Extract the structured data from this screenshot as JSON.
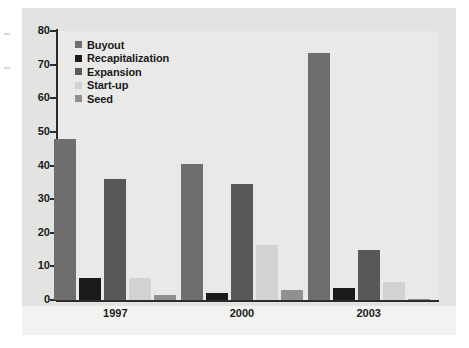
{
  "chart_data": {
    "type": "bar",
    "title": "",
    "xlabel": "",
    "ylabel": "",
    "ylim": [
      0,
      80
    ],
    "yticks": [
      0,
      10,
      20,
      30,
      40,
      50,
      60,
      70,
      80
    ],
    "grid": false,
    "legend_position": "top-left",
    "categories": [
      "1997",
      "2000",
      "2003"
    ],
    "series": [
      {
        "name": "Buyout",
        "color": "#6e6e6e",
        "values": [
          48,
          40.5,
          73.5
        ]
      },
      {
        "name": "Recapitalization",
        "color": "#1a1a1a",
        "values": [
          6.5,
          2,
          3.5
        ]
      },
      {
        "name": "Expansion",
        "color": "#585858",
        "values": [
          36,
          34.5,
          15
        ]
      },
      {
        "name": "Start-up",
        "color": "#d2d2d0",
        "values": [
          6.5,
          16.5,
          5.5
        ]
      },
      {
        "name": "Seed",
        "color": "#909090",
        "values": [
          1.5,
          3,
          0.4
        ]
      }
    ]
  },
  "colors": {
    "plate_background": "#e3e3e1",
    "panel_background": "#e9e9e7",
    "axis": "#2b2b2b",
    "text": "#1a1a1a",
    "page_background": "#ffffff"
  }
}
